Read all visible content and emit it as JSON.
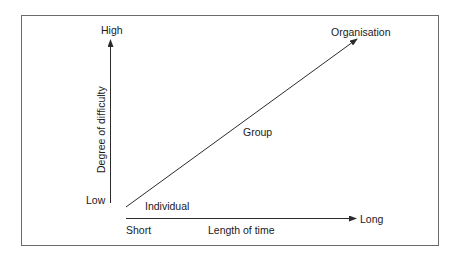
{
  "diagram": {
    "type": "conceptual-axes",
    "y_axis": {
      "label": "Degree of difficulty",
      "high_label": "High",
      "low_label": "Low"
    },
    "x_axis": {
      "label": "Length of time",
      "start_label": "Short",
      "end_label": "Long"
    },
    "trend_line": {
      "direction": "increasing",
      "points": [
        {
          "label": "Individual",
          "position": "start"
        },
        {
          "label": "Group",
          "position": "middle"
        },
        {
          "label": "Organisation",
          "position": "end"
        }
      ]
    },
    "colors": {
      "line": "#2a2a2a",
      "frame": "#6a6a6a",
      "text": "#1a1a1a"
    }
  }
}
